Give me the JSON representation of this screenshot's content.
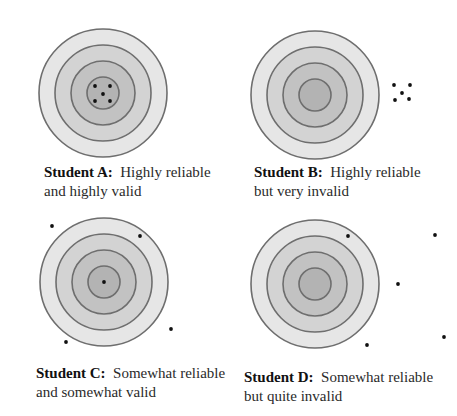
{
  "figure": {
    "colors": {
      "ring1": "#e6e6e6",
      "ring2": "#d3d3d3",
      "ring3": "#c2c2c2",
      "bullseye": "#b3b3b3",
      "stroke": "#6e6e6e",
      "dot": "#111111",
      "background": "#ffffff"
    },
    "ring_radii": [
      64,
      48,
      32,
      16
    ],
    "targets": [
      {
        "id": "A",
        "center": [
          103,
          93
        ],
        "dots": [
          [
            95,
            86
          ],
          [
            110,
            86
          ],
          [
            103,
            94
          ],
          [
            95,
            101
          ],
          [
            110,
            101
          ]
        ],
        "caption": {
          "label": "Student A:",
          "line1": "Highly reliable",
          "line2": "and highly valid"
        }
      },
      {
        "id": "B",
        "center": [
          315,
          95
        ],
        "dots": [
          [
            394,
            85
          ],
          [
            410,
            85
          ],
          [
            402,
            93
          ],
          [
            395,
            100
          ],
          [
            409,
            99
          ]
        ],
        "caption": {
          "label": "Student B:",
          "line1": "Highly reliable",
          "line2": "but very invalid"
        }
      },
      {
        "id": "C",
        "center": [
          104,
          282
        ],
        "dots": [
          [
            52,
            226
          ],
          [
            140,
            236
          ],
          [
            104,
            282
          ],
          [
            171,
            329
          ],
          [
            66,
            342
          ]
        ],
        "caption": {
          "label": "Student C:",
          "line1": "Somewhat reliable",
          "line2": "and somewhat valid"
        }
      },
      {
        "id": "D",
        "center": [
          315,
          284
        ],
        "dots": [
          [
            348,
            236
          ],
          [
            435,
            235
          ],
          [
            398,
            284
          ],
          [
            367,
            345
          ],
          [
            444,
            337
          ]
        ],
        "caption": {
          "label": "Student D:",
          "line1": "Somewhat reliable",
          "line2": "but quite invalid"
        }
      }
    ]
  }
}
